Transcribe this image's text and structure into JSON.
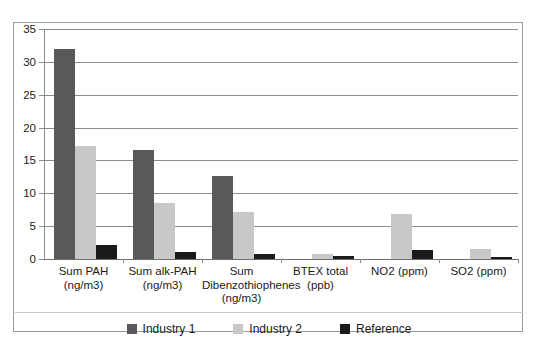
{
  "chart_data": {
    "type": "bar",
    "title": "",
    "xlabel": "",
    "ylabel": "",
    "ylim": [
      0,
      35
    ],
    "ytick_step": 5,
    "yticks": [
      35,
      30,
      25,
      20,
      15,
      10,
      5,
      0
    ],
    "grid": true,
    "legend_position": "bottom-center",
    "categories": [
      "Sum PAH (ng/m3)",
      "Sum alk-PAH (ng/m3)",
      "Sum Dibenzothiophenes (ng/m3)",
      "BTEX total (ppb)",
      "NO2 (ppm)",
      "SO2 (ppm)"
    ],
    "category_lines": [
      [
        "Sum PAH",
        "(ng/m3)"
      ],
      [
        "Sum alk-PAH",
        "(ng/m3)"
      ],
      [
        "Sum",
        "Dibenzothiophenes",
        "(ng/m3)"
      ],
      [
        "BTEX total",
        "(ppb)"
      ],
      [
        "NO2 (ppm)"
      ],
      [
        "SO2 (ppm)"
      ]
    ],
    "series": [
      {
        "name": "Industry 1",
        "color": "#595959",
        "values": [
          32.0,
          16.6,
          12.6,
          0.0,
          0.0,
          0.0
        ]
      },
      {
        "name": "Industry 2",
        "color": "#c8c8c8",
        "values": [
          17.2,
          8.6,
          7.2,
          0.8,
          6.8,
          1.5
        ]
      },
      {
        "name": "Reference",
        "color": "#1a1a1a",
        "values": [
          2.1,
          1.0,
          0.8,
          0.4,
          1.4,
          0.3
        ]
      }
    ]
  },
  "legend": {
    "items": [
      {
        "label": "Industry 1",
        "color": "#595959"
      },
      {
        "label": "Industry 2",
        "color": "#c8c8c8"
      },
      {
        "label": "Reference",
        "color": "#1a1a1a"
      }
    ]
  }
}
